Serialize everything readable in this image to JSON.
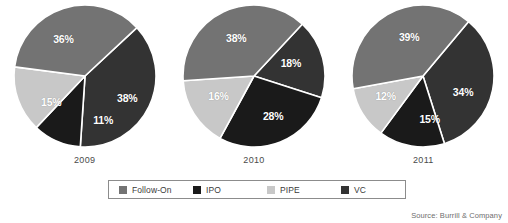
{
  "chart_data": {
    "type": "pie",
    "title": "",
    "legend_position": "bottom",
    "series_names": [
      "Follow-On",
      "IPO",
      "PIPE",
      "VC"
    ],
    "colors": {
      "Follow-On": "#737373",
      "IPO": "#1a1a1a",
      "PIPE": "#c8c8c8",
      "VC": "#333333"
    },
    "charts": [
      {
        "label": "2009",
        "start_angle": 43,
        "slices": [
          {
            "name": "VC",
            "value": 38,
            "label": "38%",
            "color": "#333333",
            "lx": 0.6,
            "ly": 0.31
          },
          {
            "name": "IPO",
            "value": 11,
            "label": "11%",
            "color": "#1a1a1a",
            "lx": 0.26,
            "ly": 0.62
          },
          {
            "name": "PIPE",
            "value": 15,
            "label": "15%",
            "color": "#c8c8c8",
            "lx": -0.47,
            "ly": 0.36
          },
          {
            "name": "Follow-On",
            "value": 36,
            "label": "36%",
            "color": "#737373",
            "lx": -0.3,
            "ly": -0.52
          }
        ]
      },
      {
        "label": "2010",
        "start_angle": 47,
        "slices": [
          {
            "name": "VC",
            "value": 18,
            "label": "18%",
            "color": "#333333",
            "lx": 0.52,
            "ly": -0.18
          },
          {
            "name": "IPO",
            "value": 28,
            "label": "28%",
            "color": "#1a1a1a",
            "lx": 0.27,
            "ly": 0.56
          },
          {
            "name": "PIPE",
            "value": 16,
            "label": "16%",
            "color": "#c8c8c8",
            "lx": -0.5,
            "ly": 0.28
          },
          {
            "name": "Follow-On",
            "value": 38,
            "label": "38%",
            "color": "#737373",
            "lx": -0.25,
            "ly": -0.53
          }
        ]
      },
      {
        "label": "2011",
        "start_angle": 50,
        "slices": [
          {
            "name": "VC",
            "value": 34,
            "label": "34%",
            "color": "#333333",
            "lx": 0.56,
            "ly": 0.22
          },
          {
            "name": "IPO",
            "value": 15,
            "label": "15%",
            "color": "#1a1a1a",
            "lx": 0.09,
            "ly": 0.6
          },
          {
            "name": "PIPE",
            "value": 12,
            "label": "12%",
            "color": "#c8c8c8",
            "lx": -0.53,
            "ly": 0.28
          },
          {
            "name": "Follow-On",
            "value": 39,
            "label": "39%",
            "color": "#737373",
            "lx": -0.2,
            "ly": -0.55
          }
        ]
      }
    ]
  },
  "legend": {
    "items": [
      {
        "label": "Follow-On",
        "color": "#737373"
      },
      {
        "label": "IPO",
        "color": "#1a1a1a"
      },
      {
        "label": "PIPE",
        "color": "#c8c8c8"
      },
      {
        "label": "VC",
        "color": "#333333"
      }
    ]
  },
  "source": {
    "text": "Source: Burrill & Company"
  }
}
